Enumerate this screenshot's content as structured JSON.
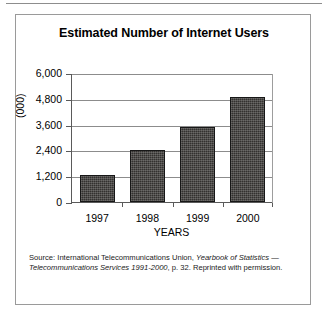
{
  "figure": {
    "title": "Estimated Number of Internet Users",
    "source_note_segments": [
      {
        "text": "Source: International Telecommunications Union,  ",
        "italic": false
      },
      {
        "text": "Yearbook of Statistics",
        "italic": true
      },
      {
        "text": " ",
        "italic": false
      },
      {
        "text": "— Telecommunications Services 1991-2000",
        "italic": true
      },
      {
        "text": ", p. 32. Reprinted with permission.",
        "italic": false
      }
    ],
    "source_note_plain": "Source: International Telecommunications Union,  Yearbook of Statistics — Telecommunications Services 1991-2000, p. 32. Reprinted with permission."
  },
  "chart_data": {
    "type": "bar",
    "title": "Estimated Number of Internet Users",
    "xlabel": "YEARS",
    "ylabel": "(000)",
    "categories": [
      "1997",
      "1998",
      "1999",
      "2000"
    ],
    "values": [
      1270,
      2430,
      3500,
      4900
    ],
    "ylim": [
      0,
      6000
    ],
    "yticks": [
      0,
      1200,
      2400,
      3600,
      4800,
      6000
    ],
    "ytick_labels": [
      "0",
      "1,200",
      "2,400",
      "3,600",
      "4,800",
      "6,000"
    ],
    "grid": true,
    "legend": null,
    "bar_color": "#33312f",
    "series": [
      {
        "name": "Estimated Number of Internet Users (000)",
        "values": [
          1270,
          2430,
          3500,
          4900
        ]
      }
    ]
  }
}
